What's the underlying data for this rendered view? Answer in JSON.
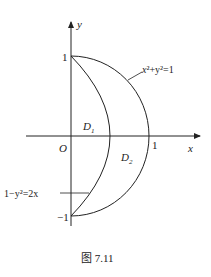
{
  "figure": {
    "caption": "图 7.11",
    "axes": {
      "x_label": "x",
      "y_label": "y",
      "origin_label": "O"
    },
    "ticks": {
      "y_top": "1",
      "y_bottom": "−1",
      "x_right": "1"
    },
    "curves": [
      {
        "name": "circle",
        "label_lhs": "x",
        "label_eq": "²+y²=1",
        "equation": "x²+y²=1"
      },
      {
        "name": "parabola",
        "equation": "1−y²=2x"
      }
    ],
    "regions": [
      {
        "label": "D",
        "sub": "1"
      },
      {
        "label": "D",
        "sub": "2"
      }
    ],
    "colors": {
      "stroke": "#222222",
      "background": "#ffffff"
    }
  }
}
